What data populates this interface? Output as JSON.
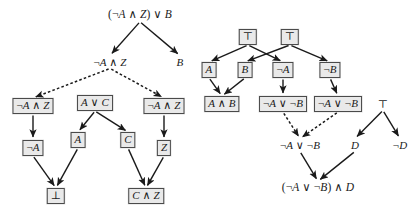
{
  "figure": {
    "background_color": "#ffffff",
    "node_box_fill": "#e9e9e9",
    "node_box_border": "#4a4a4a",
    "edge_color": "#1a1a1a"
  },
  "left_graph": {
    "name": "left-derivation-graph",
    "nodes": [
      {
        "id": "L0",
        "label": "(¬A ∧ Z) ∨ B",
        "boxed": false,
        "x": 140,
        "y": 15
      },
      {
        "id": "L1",
        "label": "¬A ∧ Z",
        "boxed": false,
        "x": 110,
        "y": 62
      },
      {
        "id": "L2",
        "label": "B",
        "boxed": false,
        "x": 180,
        "y": 62
      },
      {
        "id": "L3",
        "label": "¬A ∧ Z",
        "boxed": true,
        "x": 33,
        "y": 106
      },
      {
        "id": "L4",
        "label": "A ∨ C",
        "boxed": true,
        "x": 95,
        "y": 103
      },
      {
        "id": "L5",
        "label": "¬A ∧ Z",
        "boxed": true,
        "x": 164,
        "y": 106
      },
      {
        "id": "L6",
        "label": "¬A",
        "boxed": true,
        "x": 33,
        "y": 148
      },
      {
        "id": "L7",
        "label": "A",
        "boxed": true,
        "x": 78,
        "y": 140
      },
      {
        "id": "L8",
        "label": "C",
        "boxed": true,
        "x": 128,
        "y": 140
      },
      {
        "id": "L9",
        "label": "Z",
        "boxed": true,
        "x": 164,
        "y": 148
      },
      {
        "id": "L10",
        "label": "⊥",
        "boxed": true,
        "x": 56,
        "y": 196
      },
      {
        "id": "L11",
        "label": "C ∧ Z",
        "boxed": true,
        "x": 146,
        "y": 196
      }
    ],
    "edges": [
      {
        "from": "L0",
        "to": "L1",
        "style": "solid"
      },
      {
        "from": "L0",
        "to": "L2",
        "style": "solid"
      },
      {
        "from": "L1",
        "to": "L3",
        "style": "dashed"
      },
      {
        "from": "L1",
        "to": "L5",
        "style": "dashed"
      },
      {
        "from": "L3",
        "to": "L6",
        "style": "solid"
      },
      {
        "from": "L4",
        "to": "L7",
        "style": "solid"
      },
      {
        "from": "L4",
        "to": "L8",
        "style": "solid"
      },
      {
        "from": "L5",
        "to": "L9",
        "style": "solid"
      },
      {
        "from": "L6",
        "to": "L10",
        "style": "solid"
      },
      {
        "from": "L7",
        "to": "L10",
        "style": "solid"
      },
      {
        "from": "L8",
        "to": "L11",
        "style": "solid"
      },
      {
        "from": "L9",
        "to": "L11",
        "style": "solid"
      }
    ]
  },
  "right_graph": {
    "name": "right-derivation-graph",
    "nodes": [
      {
        "id": "R0",
        "label": "⊤",
        "boxed": true,
        "x": 248,
        "y": 37
      },
      {
        "id": "R1",
        "label": "⊤",
        "boxed": true,
        "x": 290,
        "y": 37
      },
      {
        "id": "R2",
        "label": "A",
        "boxed": true,
        "x": 209,
        "y": 70
      },
      {
        "id": "R3",
        "label": "B",
        "boxed": true,
        "x": 245,
        "y": 70
      },
      {
        "id": "R4",
        "label": "¬A",
        "boxed": true,
        "x": 283,
        "y": 70
      },
      {
        "id": "R5",
        "label": "¬B",
        "boxed": true,
        "x": 330,
        "y": 70
      },
      {
        "id": "R6",
        "label": "A ∧ B",
        "boxed": true,
        "x": 222,
        "y": 104
      },
      {
        "id": "R7",
        "label": "¬A ∨ ¬B",
        "boxed": true,
        "x": 283,
        "y": 104
      },
      {
        "id": "R8",
        "label": "¬A ∨ ¬B",
        "boxed": true,
        "x": 338,
        "y": 104
      },
      {
        "id": "R9",
        "label": "⊤",
        "boxed": false,
        "x": 383,
        "y": 104
      },
      {
        "id": "R10",
        "label": "¬A ∨ ¬B",
        "boxed": false,
        "x": 300,
        "y": 145
      },
      {
        "id": "R11",
        "label": "D",
        "boxed": false,
        "x": 355,
        "y": 145
      },
      {
        "id": "R12",
        "label": "¬D",
        "boxed": false,
        "x": 400,
        "y": 145
      },
      {
        "id": "R13",
        "label": "(¬A ∨ ¬B) ∧ D",
        "boxed": false,
        "x": 318,
        "y": 188
      }
    ],
    "edges": [
      {
        "from": "R0",
        "to": "R2",
        "style": "solid"
      },
      {
        "from": "R0",
        "to": "R4",
        "style": "solid"
      },
      {
        "from": "R1",
        "to": "R3",
        "style": "solid"
      },
      {
        "from": "R1",
        "to": "R5",
        "style": "solid"
      },
      {
        "from": "R2",
        "to": "R6",
        "style": "solid"
      },
      {
        "from": "R3",
        "to": "R6",
        "style": "solid"
      },
      {
        "from": "R4",
        "to": "R7",
        "style": "solid"
      },
      {
        "from": "R5",
        "to": "R8",
        "style": "solid"
      },
      {
        "from": "R7",
        "to": "R10",
        "style": "dashed"
      },
      {
        "from": "R8",
        "to": "R10",
        "style": "dashed"
      },
      {
        "from": "R9",
        "to": "R11",
        "style": "solid"
      },
      {
        "from": "R9",
        "to": "R12",
        "style": "solid"
      },
      {
        "from": "R10",
        "to": "R13",
        "style": "solid"
      },
      {
        "from": "R11",
        "to": "R13",
        "style": "solid"
      }
    ]
  }
}
